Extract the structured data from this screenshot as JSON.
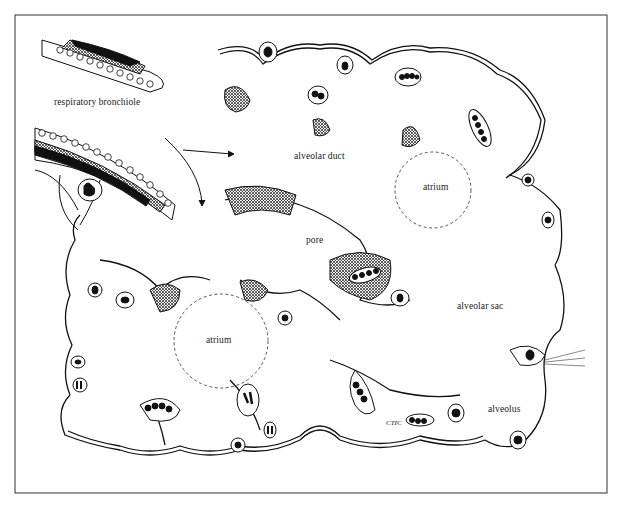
{
  "figure": {
    "type": "histology-illustration",
    "frame": {
      "x": 15,
      "y": 15,
      "width": 592,
      "height": 478,
      "stroke": "#333333"
    },
    "colors": {
      "ink": "#111111",
      "background": "#ffffff",
      "dashed_outline": "#444444"
    }
  },
  "labels": {
    "respiratory_bronchiole": "respiratory bronchiole",
    "alveolar_duct": "alveolar duct",
    "atrium_top": "atrium",
    "pore": "pore",
    "atrium_bottom": "atrium",
    "alveolar_sac": "alveolar sac",
    "alveolus": "alveolus"
  },
  "signature": {
    "initials": "CTIC",
    "year": "'84"
  },
  "atria": [
    {
      "name": "atrium-top",
      "cx": 433,
      "cy": 190,
      "r": 38
    },
    {
      "name": "atrium-bottom",
      "cx": 221,
      "cy": 341,
      "r": 47
    }
  ]
}
